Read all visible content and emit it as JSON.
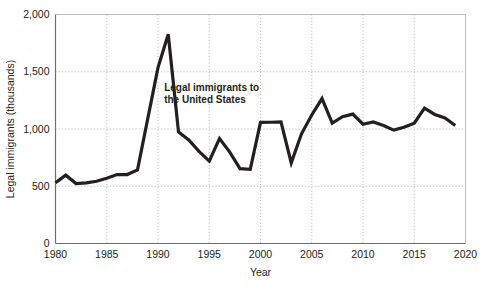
{
  "chart_data": {
    "type": "line",
    "title": "",
    "xlabel": "Year",
    "ylabel": "Legal immigrants (thousands)",
    "xlim": [
      1980,
      2020
    ],
    "ylim": [
      0,
      2000
    ],
    "grid": true,
    "legend_position": "none",
    "xticks": [
      "1980",
      "1985",
      "1990",
      "1995",
      "2000",
      "2005",
      "2010",
      "2015",
      "2020"
    ],
    "xtick_values": [
      1980,
      1985,
      1990,
      1995,
      2000,
      2005,
      2010,
      2015,
      2020
    ],
    "yticks": [
      "0",
      "500",
      "1,000",
      "1,500",
      "2,000"
    ],
    "ytick_values": [
      0,
      500,
      1000,
      1500,
      2000
    ],
    "annotations": [
      {
        "name": "series-annotation",
        "line1": "Legal immigrants to",
        "line2": "the United States",
        "x": 1990.6,
        "y": 1330
      }
    ],
    "series": [
      {
        "name": "Legal immigrants to the United States",
        "color": "#231f20",
        "x": [
          1980,
          1981,
          1982,
          1983,
          1984,
          1985,
          1986,
          1987,
          1988,
          1989,
          1990,
          1991,
          1992,
          1993,
          1994,
          1995,
          1996,
          1997,
          1998,
          1999,
          2000,
          2001,
          2002,
          2003,
          2004,
          2005,
          2006,
          2007,
          2008,
          2009,
          2010,
          2011,
          2012,
          2013,
          2014,
          2015,
          2016,
          2017,
          2018,
          2019
        ],
        "values": [
          531,
          597,
          524,
          530,
          544,
          570,
          602,
          602,
          643,
          1091,
          1536,
          1827,
          974,
          904,
          804,
          720,
          916,
          798,
          654,
          647,
          1058,
          1059,
          1063,
          704,
          958,
          1122,
          1266,
          1052,
          1107,
          1130,
          1042,
          1062,
          1031,
          990,
          1016,
          1051,
          1183,
          1127,
          1096,
          1031
        ]
      }
    ]
  }
}
